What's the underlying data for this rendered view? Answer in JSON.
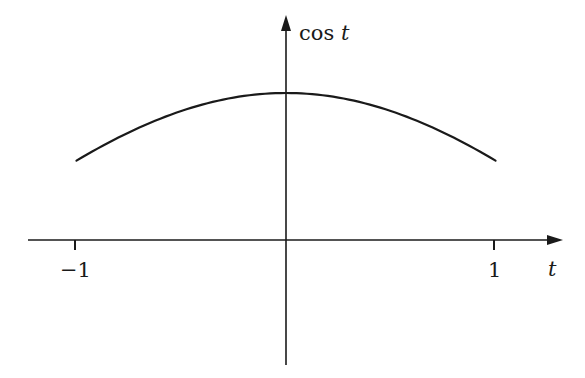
{
  "chart_data": {
    "type": "line",
    "title": "",
    "xlabel": "t",
    "ylabel": "cos t",
    "x_tick_labels": [
      "-1",
      "1"
    ],
    "x_ticks": [
      -1,
      1
    ],
    "xlim": [
      -1.0,
      1.3
    ],
    "ylim": [
      -0.85,
      1.55
    ],
    "grid": false,
    "legend": null,
    "series": [
      {
        "name": "cos t",
        "function": "cos(t)",
        "domain": [
          -1,
          1
        ],
        "x": [
          -1,
          -0.75,
          -0.5,
          -0.25,
          0,
          0.25,
          0.5,
          0.75,
          1
        ],
        "values": [
          0.5403,
          0.7317,
          0.8776,
          0.9689,
          1.0,
          0.9689,
          0.8776,
          0.7317,
          0.5403
        ]
      }
    ]
  },
  "labels": {
    "y_axis_cos": "cos",
    "y_axis_t": "t",
    "x_axis": "t",
    "tick_neg1": "−1",
    "tick_pos1": "1"
  },
  "colors": {
    "ink": "#1a1a1a",
    "background": "#ffffff"
  }
}
